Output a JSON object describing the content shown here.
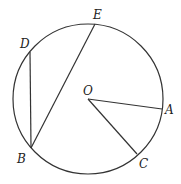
{
  "diagram": {
    "type": "circle-geometry",
    "circle": {
      "cx": 88,
      "cy": 99,
      "r": 75,
      "center_label": "O"
    },
    "points": {
      "O": {
        "label": "O",
        "x": 88,
        "y": 99,
        "label_x": 83,
        "label_y": 95
      },
      "A": {
        "label": "A",
        "x": 162,
        "y": 109,
        "label_x": 165,
        "label_y": 114
      },
      "B": {
        "label": "B",
        "x": 31,
        "y": 148,
        "label_x": 17,
        "label_y": 163
      },
      "C": {
        "label": "C",
        "x": 137,
        "y": 154,
        "label_x": 139,
        "label_y": 168
      },
      "D": {
        "label": "D",
        "x": 30,
        "y": 52,
        "label_x": 20,
        "label_y": 48
      },
      "E": {
        "label": "E",
        "x": 95,
        "y": 24,
        "label_x": 93,
        "label_y": 19
      }
    },
    "segments": [
      {
        "name": "OA",
        "from": "O",
        "to": "A"
      },
      {
        "name": "OC",
        "from": "O",
        "to": "C"
      },
      {
        "name": "DB",
        "from": "D",
        "to": "B"
      },
      {
        "name": "BE",
        "from": "B",
        "to": "E"
      }
    ],
    "colors": {
      "line": "#333333",
      "text": "#222222",
      "background": "#ffffff"
    }
  }
}
